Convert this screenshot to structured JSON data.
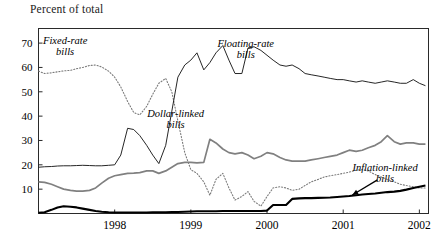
{
  "chart_data": {
    "type": "line",
    "title": "Percent of total",
    "xlabel": "",
    "ylabel": "Percent of total",
    "xlim": [
      1997.0,
      2002.12
    ],
    "ylim": [
      0,
      76
    ],
    "grid": false,
    "legend_position": "inline-annotations",
    "yticks": [
      10,
      20,
      30,
      40,
      50,
      60,
      70
    ],
    "ytick_labels": [
      "10",
      "20",
      "30",
      "40",
      "50",
      "60",
      "70"
    ],
    "xticks": [
      1998,
      1999,
      2000,
      2001,
      2002
    ],
    "xtick_labels": [
      "1998",
      "1999",
      "2000",
      "2001",
      "2002"
    ],
    "annotations": [
      {
        "name": "fixed-rate-bills",
        "text_line1": "Fixed-rate",
        "text_line2": "bills",
        "x": 1997.35,
        "y": 69.5
      },
      {
        "name": "floating-rate-bills",
        "text_line1": "Floating-rate",
        "text_line2": "bills",
        "x": 1999.72,
        "y": 68.5
      },
      {
        "name": "dollar-linked-bills",
        "text_line1": "Dollar-linked",
        "text_line2": "bills",
        "x": 1998.8,
        "y": 39.5
      },
      {
        "name": "inflation-linked-bills",
        "text_line1": "Inflation-linked",
        "text_line2": "bills",
        "x": 2001.55,
        "y": 17.5
      }
    ],
    "arrow": {
      "name": "inflation-linked-arrow",
      "x_from": 2001.45,
      "y_from": 13.8,
      "x_to": 2001.12,
      "y_to": 7.6
    },
    "series": [
      {
        "name": "Fixed-rate bills",
        "style": "dotted",
        "color": "#7a7a7a",
        "x": [
          1997.0,
          1997.08,
          1997.17,
          1997.25,
          1997.33,
          1997.42,
          1997.5,
          1997.58,
          1997.67,
          1997.75,
          1997.83,
          1997.92,
          1998.0,
          1998.08,
          1998.17,
          1998.25,
          1998.33,
          1998.42,
          1998.5,
          1998.58,
          1998.67,
          1998.75,
          1998.83,
          1998.92,
          1999.0,
          1999.08,
          1999.17,
          1999.25,
          1999.33,
          1999.42,
          1999.5,
          1999.58,
          1999.67,
          1999.75,
          1999.83,
          1999.92,
          2000.0,
          2000.08,
          2000.17,
          2000.25,
          2000.33,
          2000.42,
          2000.5,
          2000.58,
          2000.67,
          2000.75,
          2000.83,
          2000.92,
          2001.0,
          2001.08,
          2001.17,
          2001.25,
          2001.33,
          2001.42,
          2001.5,
          2001.58,
          2001.67,
          2001.75,
          2001.83,
          2001.92,
          2002.0,
          2002.08
        ],
        "values": [
          58.5,
          57.5,
          57.8,
          58.2,
          58.6,
          58.8,
          59.5,
          60.0,
          60.8,
          61.0,
          60.2,
          58.5,
          56.0,
          52.0,
          46.0,
          41.5,
          40.5,
          44.0,
          49.0,
          53.5,
          55.5,
          50.0,
          38.0,
          25.0,
          18.0,
          16.5,
          13.0,
          7.5,
          14.0,
          16.5,
          10.5,
          5.5,
          7.0,
          9.0,
          5.0,
          3.0,
          7.0,
          10.5,
          11.0,
          10.5,
          9.5,
          10.0,
          11.5,
          13.0,
          14.0,
          15.0,
          15.5,
          16.0,
          16.5,
          17.0,
          17.8,
          18.0,
          17.5,
          16.0,
          15.0,
          14.0,
          13.0,
          12.0,
          11.5,
          11.0,
          10.5,
          10.5
        ]
      },
      {
        "name": "Floating-rate bills",
        "style": "solid-thin",
        "color": "#1a1a1a",
        "x": [
          1997.0,
          1997.08,
          1997.17,
          1997.25,
          1997.33,
          1997.42,
          1997.5,
          1997.58,
          1997.67,
          1997.75,
          1997.83,
          1997.92,
          1998.0,
          1998.08,
          1998.17,
          1998.25,
          1998.33,
          1998.42,
          1998.5,
          1998.58,
          1998.67,
          1998.75,
          1998.83,
          1998.92,
          1999.0,
          1999.08,
          1999.17,
          1999.25,
          1999.33,
          1999.42,
          1999.5,
          1999.58,
          1999.67,
          1999.75,
          1999.83,
          1999.92,
          2000.0,
          2000.08,
          2000.17,
          2000.25,
          2000.33,
          2000.42,
          2000.5,
          2000.58,
          2000.67,
          2000.75,
          2000.83,
          2000.92,
          2001.0,
          2001.08,
          2001.17,
          2001.25,
          2001.33,
          2001.42,
          2001.5,
          2001.58,
          2001.67,
          2001.75,
          2001.83,
          2001.92,
          2002.0,
          2002.08
        ],
        "values": [
          19.0,
          19.2,
          19.3,
          19.5,
          19.6,
          19.6,
          19.7,
          19.8,
          19.7,
          19.6,
          19.6,
          19.8,
          20.0,
          24.0,
          35.0,
          34.5,
          32.0,
          28.0,
          24.0,
          20.5,
          28.0,
          42.0,
          56.0,
          61.0,
          63.0,
          66.0,
          59.0,
          62.0,
          66.0,
          69.0,
          63.0,
          57.5,
          57.5,
          68.0,
          68.5,
          67.0,
          65.0,
          63.0,
          61.0,
          60.5,
          61.0,
          59.5,
          57.5,
          57.0,
          56.5,
          56.0,
          55.5,
          55.0,
          55.0,
          54.5,
          54.0,
          54.5,
          54.0,
          53.5,
          54.0,
          54.5,
          54.0,
          53.5,
          53.5,
          55.0,
          53.5,
          52.5
        ]
      },
      {
        "name": "Dollar-linked bills",
        "style": "solid-gray",
        "color": "#808080",
        "x": [
          1997.0,
          1997.08,
          1997.17,
          1997.25,
          1997.33,
          1997.42,
          1997.5,
          1997.58,
          1997.67,
          1997.75,
          1997.83,
          1997.92,
          1998.0,
          1998.08,
          1998.17,
          1998.25,
          1998.33,
          1998.42,
          1998.5,
          1998.58,
          1998.67,
          1998.75,
          1998.83,
          1998.92,
          1999.0,
          1999.08,
          1999.17,
          1999.25,
          1999.33,
          1999.42,
          1999.5,
          1999.58,
          1999.67,
          1999.75,
          1999.83,
          1999.92,
          2000.0,
          2000.08,
          2000.17,
          2000.25,
          2000.33,
          2000.42,
          2000.5,
          2000.58,
          2000.67,
          2000.75,
          2000.83,
          2000.92,
          2001.0,
          2001.08,
          2001.17,
          2001.25,
          2001.33,
          2001.42,
          2001.5,
          2001.58,
          2001.67,
          2001.75,
          2001.83,
          2001.92,
          2002.0,
          2002.08
        ],
        "values": [
          13.0,
          12.8,
          12.0,
          11.0,
          10.0,
          9.5,
          9.2,
          9.2,
          9.5,
          10.5,
          12.5,
          14.5,
          15.5,
          16.0,
          16.5,
          16.6,
          16.8,
          17.5,
          17.5,
          16.5,
          17.5,
          19.0,
          20.5,
          21.0,
          21.0,
          20.8,
          21.0,
          30.5,
          29.0,
          26.5,
          25.0,
          24.5,
          25.0,
          24.0,
          22.5,
          23.5,
          25.0,
          24.5,
          23.0,
          22.0,
          21.5,
          21.5,
          21.5,
          22.0,
          22.5,
          23.0,
          23.5,
          24.0,
          25.0,
          26.0,
          25.5,
          26.0,
          27.0,
          28.0,
          29.5,
          32.0,
          29.5,
          28.5,
          29.0,
          29.0,
          28.5,
          28.5
        ]
      },
      {
        "name": "Inflation-linked bills",
        "style": "solid-thick",
        "color": "#000000",
        "x": [
          1997.0,
          1997.08,
          1997.17,
          1997.25,
          1997.33,
          1997.42,
          1997.5,
          1997.58,
          1997.67,
          1997.75,
          1997.83,
          1997.92,
          1998.0,
          1998.08,
          1998.17,
          1998.25,
          1998.33,
          1998.42,
          1998.5,
          1998.58,
          1998.67,
          1998.75,
          1998.83,
          1998.92,
          1999.0,
          1999.08,
          1999.17,
          1999.25,
          1999.33,
          1999.42,
          1999.5,
          1999.58,
          1999.67,
          1999.75,
          1999.83,
          1999.92,
          2000.0,
          2000.08,
          2000.17,
          2000.25,
          2000.33,
          2000.42,
          2000.5,
          2000.58,
          2000.67,
          2000.75,
          2000.83,
          2000.92,
          2001.0,
          2001.08,
          2001.17,
          2001.25,
          2001.33,
          2001.42,
          2001.5,
          2001.58,
          2001.67,
          2001.75,
          2001.83,
          2001.92,
          2002.0,
          2002.08
        ],
        "values": [
          0.3,
          0.5,
          1.5,
          2.5,
          3.0,
          2.8,
          2.5,
          2.0,
          1.5,
          1.0,
          0.7,
          0.5,
          0.4,
          0.4,
          0.4,
          0.4,
          0.4,
          0.4,
          0.5,
          0.5,
          0.5,
          0.6,
          0.6,
          0.7,
          0.8,
          0.9,
          0.9,
          0.9,
          0.9,
          1.0,
          1.0,
          1.0,
          1.0,
          1.0,
          1.0,
          1.0,
          1.2,
          3.5,
          3.5,
          3.5,
          6.0,
          6.2,
          6.3,
          6.3,
          6.4,
          6.5,
          6.6,
          6.8,
          7.0,
          7.2,
          7.5,
          7.8,
          8.0,
          8.2,
          8.5,
          8.8,
          9.0,
          9.3,
          9.8,
          10.5,
          11.0,
          11.5
        ]
      }
    ]
  }
}
